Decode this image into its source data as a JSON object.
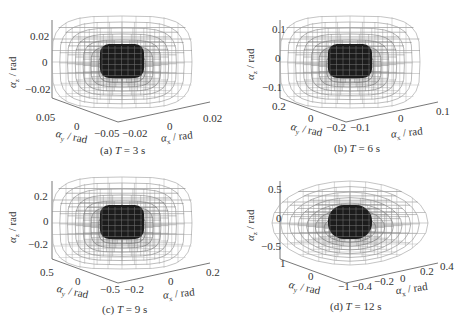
{
  "figure": {
    "panels": [
      {
        "caption_prefix": "(a) ",
        "caption_var": "T",
        "caption_suffix": " = 3 s",
        "z_label": "αz / rad",
        "y_label": "αy / rad",
        "x_label": "αx / rad",
        "z_ticks": [
          "0.02",
          "0",
          "−0.02"
        ],
        "y_ticks": [
          "0.05",
          "0",
          "−0.05"
        ],
        "x_ticks": [
          "−0.02",
          "0",
          "0.02"
        ]
      },
      {
        "caption_prefix": "(b) ",
        "caption_var": "T",
        "caption_suffix": " = 6 s",
        "z_label": "αz / rad",
        "y_label": "αy / rad",
        "x_label": "αx / rad",
        "z_ticks": [
          "0.1",
          "0",
          "−0.1"
        ],
        "y_ticks": [
          "0.2",
          "0",
          "−0.2"
        ],
        "x_ticks": [
          "−0.1",
          "0",
          "0.1"
        ]
      },
      {
        "caption_prefix": "(c) ",
        "caption_var": "T",
        "caption_suffix": " = 9 s",
        "z_label": "αz / rad",
        "y_label": "αy / rad",
        "x_label": "αx / rad",
        "z_ticks": [
          "0.2",
          "0",
          "−0.2"
        ],
        "y_ticks": [
          "0.5",
          "0",
          "−0.5"
        ],
        "x_ticks": [
          "−0.2",
          "0",
          "0.2"
        ]
      },
      {
        "caption_prefix": "(d) ",
        "caption_var": "T",
        "caption_suffix": " = 12 s",
        "z_label": "αz / rad",
        "y_label": "αy / rad",
        "x_label": "αx / rad",
        "z_ticks": [
          "0.5",
          "0",
          "−0.5"
        ],
        "y_ticks": [
          "1",
          "0",
          "−1"
        ],
        "x_ticks": [
          "−0.4",
          "−0.2",
          "0",
          "0.2",
          "0.4"
        ]
      }
    ]
  },
  "chart_data": [
    {
      "type": "3d-wireframe",
      "title": "(a) T = 3 s",
      "xlabel": "αx / rad",
      "ylabel": "αy / rad",
      "zlabel": "αz / rad",
      "xlim": [
        -0.02,
        0.02
      ],
      "ylim": [
        -0.05,
        0.05
      ],
      "zlim": [
        -0.03,
        0.03
      ],
      "x_ticks": [
        -0.02,
        0,
        0.02
      ],
      "y_ticks": [
        -0.05,
        0,
        0.05
      ],
      "z_ticks": [
        -0.02,
        0,
        0.02
      ],
      "series": [
        {
          "name": "outer reachable set",
          "shape": "nested wireframe shells, gray gradient"
        },
        {
          "name": "inner set",
          "shape": "dark compact wireframe core"
        }
      ]
    },
    {
      "type": "3d-wireframe",
      "title": "(b) T = 6 s",
      "xlabel": "αx / rad",
      "ylabel": "αy / rad",
      "zlabel": "αz / rad",
      "xlim": [
        -0.1,
        0.1
      ],
      "ylim": [
        -0.2,
        0.2
      ],
      "zlim": [
        -0.15,
        0.15
      ],
      "x_ticks": [
        -0.1,
        0,
        0.1
      ],
      "y_ticks": [
        -0.2,
        0,
        0.2
      ],
      "z_ticks": [
        -0.1,
        0,
        0.1
      ],
      "series": [
        {
          "name": "outer reachable set",
          "shape": "nested wireframe shells, gray gradient"
        },
        {
          "name": "inner set",
          "shape": "dark compact wireframe core"
        }
      ]
    },
    {
      "type": "3d-wireframe",
      "title": "(c) T = 9 s",
      "xlabel": "αx / rad",
      "ylabel": "αy / rad",
      "zlabel": "αz / rad",
      "xlim": [
        -0.2,
        0.2
      ],
      "ylim": [
        -0.5,
        0.5
      ],
      "zlim": [
        -0.3,
        0.3
      ],
      "x_ticks": [
        -0.2,
        0,
        0.2
      ],
      "y_ticks": [
        -0.5,
        0,
        0.5
      ],
      "z_ticks": [
        -0.2,
        0,
        0.2
      ],
      "series": [
        {
          "name": "outer reachable set",
          "shape": "nested wireframe shells, gray gradient"
        },
        {
          "name": "inner set",
          "shape": "dark compact wireframe core"
        }
      ]
    },
    {
      "type": "3d-wireframe",
      "title": "(d) T = 12 s",
      "xlabel": "αx / rad",
      "ylabel": "αy / rad",
      "zlabel": "αz / rad",
      "xlim": [
        -0.4,
        0.4
      ],
      "ylim": [
        -1,
        1
      ],
      "zlim": [
        -0.6,
        0.6
      ],
      "x_ticks": [
        -0.4,
        -0.2,
        0,
        0.2,
        0.4
      ],
      "y_ticks": [
        -1,
        0,
        1
      ],
      "z_ticks": [
        -0.5,
        0,
        0.5
      ],
      "series": [
        {
          "name": "outer reachable set",
          "shape": "nested wireframe shells (ellipsoidal), gray gradient"
        },
        {
          "name": "inner set",
          "shape": "dark compact wireframe core"
        }
      ]
    }
  ]
}
